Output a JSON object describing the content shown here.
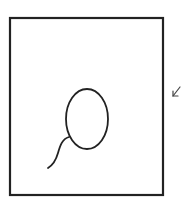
{
  "diagram": {
    "description": "Hand-drawn sketch: a rectangular frame containing a loop (ellipse) with a curving tail, and a small arrow outside the right edge pointing toward the frame",
    "stroke_color": "#222222",
    "background_color": "#ffffff",
    "frame": {
      "x": 10,
      "y": 18,
      "width": 153,
      "height": 177,
      "stroke_width": 2.2
    },
    "loop": {
      "cx": 87,
      "cy": 119,
      "rx": 21,
      "ry": 30,
      "stroke_width": 1.8
    },
    "tail": {
      "path": "M 69 137 C 62 139, 60 146, 58 153 C 56 160, 53 165, 48 168",
      "stroke_width": 1.8
    },
    "arrow": {
      "icon": "arrow-down-left-icon",
      "from": [
        180,
        86
      ],
      "to": [
        173,
        96
      ],
      "stroke_width": 1.2
    }
  }
}
